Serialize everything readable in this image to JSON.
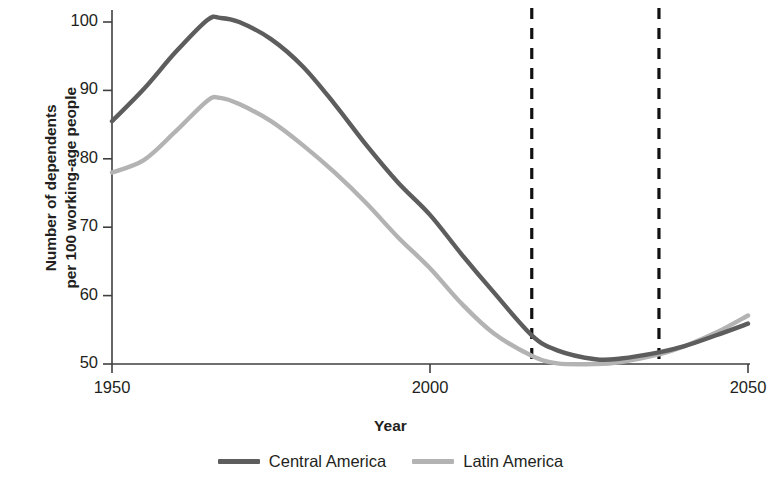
{
  "chart_data": {
    "type": "line",
    "title": "",
    "xlabel": "Year",
    "ylabel": "Number of dependents per 100 working-age people",
    "ylabel_line1": "Number of dependents",
    "ylabel_line2": "per 100 working-age people",
    "xlim": [
      1950,
      2050
    ],
    "ylim": [
      50,
      100
    ],
    "yticks": [
      50,
      60,
      70,
      80,
      90,
      100
    ],
    "ytick_labels": [
      "50",
      "60",
      "70",
      "80",
      "90",
      "100"
    ],
    "xticks": [
      1950,
      2000,
      2050
    ],
    "xtick_labels": [
      "1950",
      "2000",
      "2050"
    ],
    "grid": false,
    "legend_position": "bottom-center",
    "annotations": [
      {
        "type": "vertical-dashed-line",
        "x": 2016,
        "label": ""
      },
      {
        "type": "vertical-dashed-line",
        "x": 2036,
        "label": ""
      }
    ],
    "x": [
      1950,
      1955,
      1960,
      1965,
      1967,
      1970,
      1975,
      1980,
      1985,
      1990,
      1995,
      2000,
      2005,
      2010,
      2016,
      2020,
      2026,
      2030,
      2036,
      2040,
      2045,
      2050
    ],
    "series": [
      {
        "name": "Central America",
        "color": "#5d5d5d",
        "values": [
          85.5,
          90.2,
          95.6,
          100.3,
          100.6,
          100.0,
          97.5,
          93.5,
          88.0,
          82.0,
          76.5,
          71.8,
          66.0,
          60.5,
          54.2,
          52.0,
          50.7,
          50.8,
          51.7,
          52.6,
          54.2,
          55.9
        ]
      },
      {
        "name": "Latin America",
        "color": "#b3b3b3",
        "values": [
          78.0,
          79.8,
          84.0,
          88.5,
          88.9,
          88.0,
          85.5,
          82.0,
          78.0,
          73.5,
          68.5,
          64.0,
          58.8,
          54.5,
          51.2,
          50.1,
          50.0,
          50.3,
          51.4,
          52.6,
          54.6,
          57.1
        ]
      }
    ]
  },
  "legend": {
    "items": [
      {
        "label": "Central America",
        "color": "#5d5d5d"
      },
      {
        "label": "Latin America",
        "color": "#b3b3b3"
      }
    ]
  },
  "colors": {
    "central_america": "#5d5d5d",
    "latin_america": "#b3b3b3",
    "axis": "#3f3f3f",
    "dashed_line": "#111111",
    "text": "#231f20"
  }
}
